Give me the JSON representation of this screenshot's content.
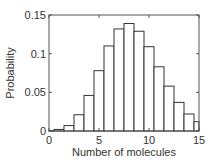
{
  "chart_data": {
    "type": "bar",
    "title": "",
    "xlabel": "Number of molecules",
    "ylabel": "Probability",
    "xlim": [
      0,
      15
    ],
    "ylim": [
      0,
      0.15
    ],
    "xticks": [
      0,
      5,
      10,
      15
    ],
    "xtick_labels": [
      "0",
      "5",
      "10",
      "15"
    ],
    "yticks": [
      0,
      0.05,
      0.1,
      0.15
    ],
    "ytick_labels": [
      "0",
      "0.05",
      "0.1",
      "0.15"
    ],
    "grid": false,
    "legend": null,
    "bar_width": 1,
    "categories": [
      0,
      1,
      2,
      3,
      4,
      5,
      6,
      7,
      8,
      9,
      10,
      11,
      12,
      13,
      14,
      15
    ],
    "values": [
      0.0005,
      0.002,
      0.007,
      0.021,
      0.046,
      0.078,
      0.11,
      0.132,
      0.139,
      0.129,
      0.109,
      0.083,
      0.058,
      0.037,
      0.022,
      0.012
    ],
    "bar_fill": "#ffffff",
    "bar_edge": "#333333"
  }
}
